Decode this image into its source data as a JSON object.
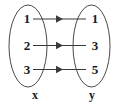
{
  "diagram": {
    "type": "mapping-diagram",
    "domain_set": {
      "name": "x",
      "elements": [
        "1",
        "2",
        "3"
      ]
    },
    "range_set": {
      "name": "y",
      "elements": [
        "1",
        "3",
        "5"
      ]
    },
    "mappings": [
      {
        "from": "1",
        "to": "1"
      },
      {
        "from": "2",
        "to": "3"
      },
      {
        "from": "3",
        "to": "5"
      }
    ],
    "colors": {
      "background": "#ffffff",
      "oval_stroke": "#4a4a4a",
      "arrow": "#3a3a3a",
      "text": "#1a1a1a"
    }
  }
}
